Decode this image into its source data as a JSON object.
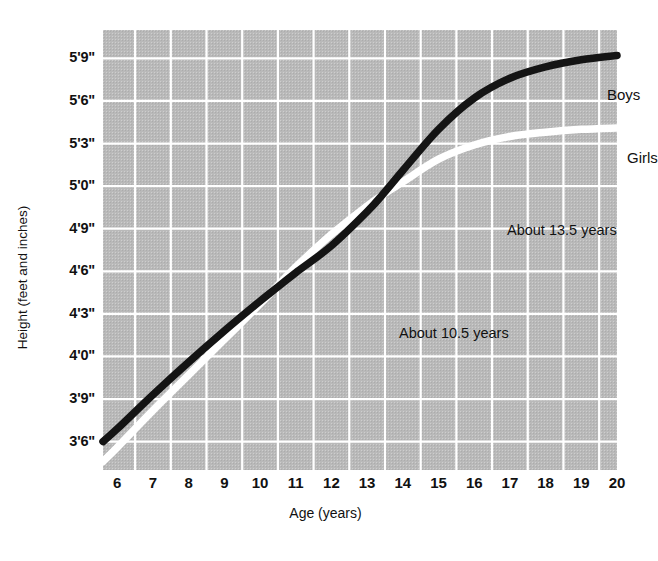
{
  "chart_data": {
    "type": "line",
    "title": "",
    "xlabel": "Age (years)",
    "ylabel": "Height (feet and inches)",
    "xlim": [
      5.6,
      20
    ],
    "ylim_inches": [
      40,
      71
    ],
    "grid": true,
    "legend_position": "inline-labels",
    "x_ticks": [
      "6",
      "7",
      "8",
      "9",
      "10",
      "11",
      "12",
      "13",
      "14",
      "15",
      "16",
      "17",
      "18",
      "19",
      "20"
    ],
    "y_ticks": [
      "3'6\"",
      "3'9\"",
      "4'0\"",
      "4'3\"",
      "4'6\"",
      "4'9\"",
      "5'0\"",
      "5'3\"",
      "5'6\"",
      "5'9\""
    ],
    "y_ticks_inches": [
      42,
      45,
      48,
      51,
      54,
      57,
      60,
      63,
      66,
      69
    ],
    "x": [
      5.6,
      6,
      7,
      8,
      9,
      10,
      10.5,
      11,
      12,
      13,
      13.5,
      14,
      15,
      16,
      17,
      18,
      19,
      20
    ],
    "series": [
      {
        "name": "Boys",
        "color": "#141414",
        "values_inches": [
          42.0,
          42.9,
          45.3,
          47.6,
          49.8,
          51.9,
          52.9,
          53.9,
          55.8,
          58.2,
          59.6,
          61.1,
          64.0,
          66.2,
          67.6,
          68.4,
          68.9,
          69.2
        ]
      },
      {
        "name": "Girls",
        "color": "#ffffff",
        "values_inches": [
          40.6,
          41.6,
          44.2,
          46.7,
          49.2,
          51.7,
          53.0,
          54.3,
          56.6,
          58.6,
          59.5,
          60.3,
          61.9,
          62.9,
          63.5,
          63.8,
          64.0,
          64.1
        ]
      }
    ],
    "annotations": [
      {
        "text": "Boys",
        "kind": "series-label",
        "series": "Boys"
      },
      {
        "text": "Girls",
        "kind": "series-label",
        "series": "Girls"
      },
      {
        "text": "About 13.5 years",
        "kind": "callout",
        "age": 13.5,
        "note": "boys peak growth spurt"
      },
      {
        "text": "About 10.5 years",
        "kind": "callout",
        "age": 10.5,
        "note": "girls peak growth spurt"
      }
    ],
    "background_color": "#b9b9b9",
    "gridline_color": "#ffffff"
  }
}
